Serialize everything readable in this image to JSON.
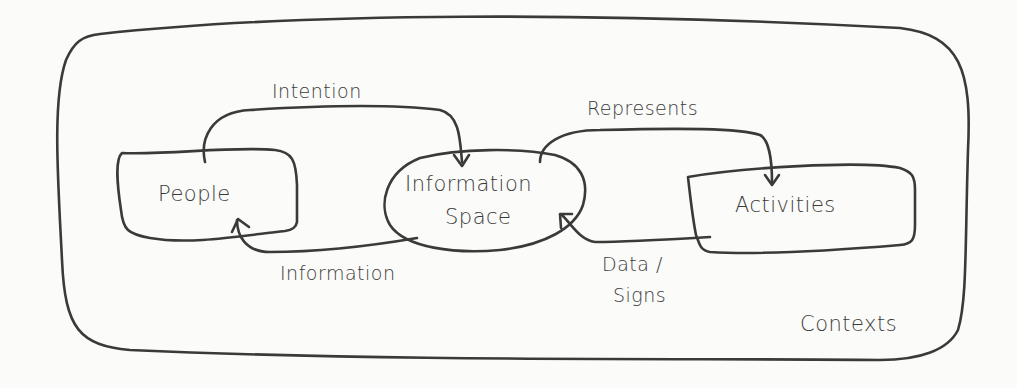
{
  "diagram": {
    "container": {
      "label": "Contexts"
    },
    "nodes": [
      {
        "id": "people",
        "label": "People",
        "shape": "rounded-box"
      },
      {
        "id": "information-space",
        "label_line1": "Information",
        "label_line2": "Space",
        "shape": "ellipse"
      },
      {
        "id": "activities",
        "label": "Activities",
        "shape": "rounded-box"
      }
    ],
    "edges": [
      {
        "from": "people",
        "to": "information-space",
        "label": "Intention"
      },
      {
        "from": "information-space",
        "to": "people",
        "label": "Information"
      },
      {
        "from": "information-space",
        "to": "activities",
        "label": "Represents"
      },
      {
        "from": "activities",
        "to": "information-space",
        "label_line1": "Data /",
        "label_line2": "Signs"
      }
    ],
    "colors": {
      "stroke": "#3a3a3a",
      "background": "#fbfbf9"
    }
  }
}
